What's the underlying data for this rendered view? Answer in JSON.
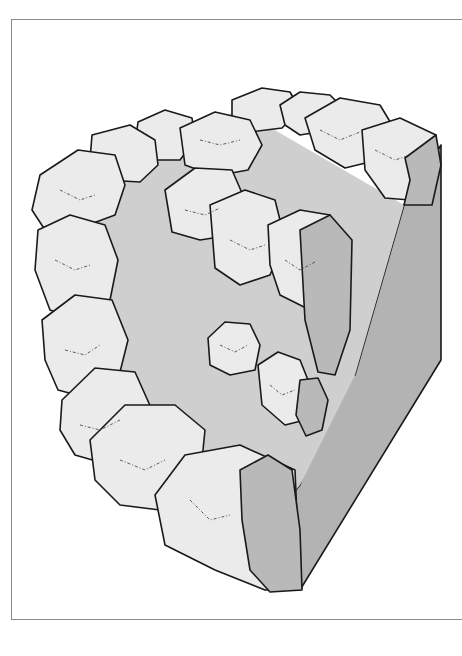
{
  "illustration": {
    "subject": "stone-ring-on-block",
    "colors": {
      "background": "#ffffff",
      "frame": "#8a8a8a",
      "stone_top": "#ebebeb",
      "stone_cut_face": "#b9b9b9",
      "floor": "#cfcfcf",
      "block_side": "#b3b3b3",
      "outline": "#1a1a1a"
    }
  }
}
